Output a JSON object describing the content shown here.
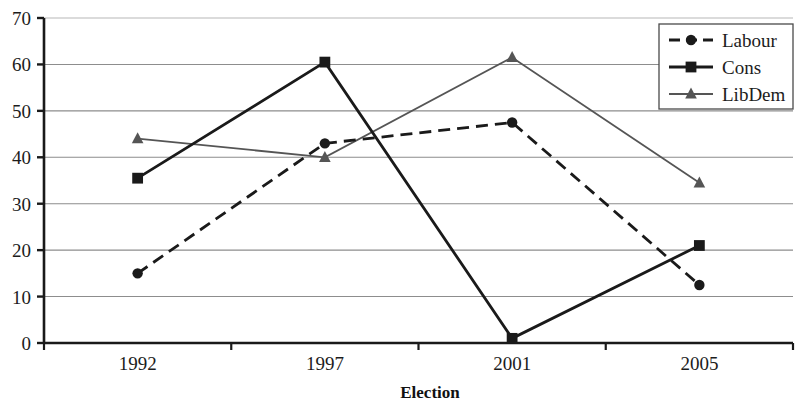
{
  "chart_data": {
    "type": "line",
    "title": "",
    "xlabel": "Election",
    "ylabel": "",
    "categories": [
      "1992",
      "1997",
      "2001",
      "2005"
    ],
    "ylim": [
      0,
      70
    ],
    "ytick_values": [
      0,
      10,
      20,
      30,
      40,
      50,
      60,
      70
    ],
    "ytick_labels": [
      "0",
      "10",
      "20",
      "30",
      "40",
      "50",
      "60",
      "70"
    ],
    "grid": true,
    "grid_axis": "y",
    "legend_position": "top-right",
    "series": [
      {
        "name": "Labour",
        "values": [
          15,
          43,
          47.5,
          12.5
        ],
        "color": "#1a1a1a",
        "line_style": "dashed",
        "marker": "circle"
      },
      {
        "name": "Cons",
        "values": [
          35.5,
          60.5,
          1,
          21
        ],
        "color": "#1a1a1a",
        "line_style": "solid",
        "marker": "square"
      },
      {
        "name": "LibDem",
        "values": [
          44,
          40,
          61.5,
          34.5
        ],
        "color": "#555555",
        "line_style": "solid",
        "marker": "triangle"
      }
    ]
  },
  "axes": {
    "y_tick_labels": [
      "70",
      "60",
      "50",
      "40",
      "30",
      "20",
      "10",
      "0"
    ],
    "x_tick_labels": [
      "1992",
      "1997",
      "2001",
      "2005"
    ],
    "x_axis_title": "Election"
  },
  "legend": {
    "entries": [
      {
        "label": "Labour"
      },
      {
        "label": "Cons"
      },
      {
        "label": "LibDem"
      }
    ]
  }
}
